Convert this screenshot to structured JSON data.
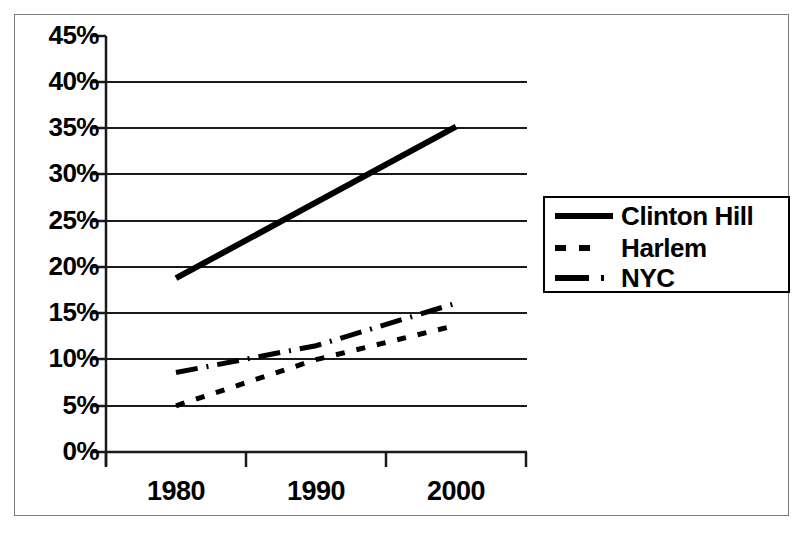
{
  "chart_data": {
    "type": "line",
    "title": "",
    "xlabel": "",
    "ylabel": "",
    "categories": [
      "1980",
      "1990",
      "2000"
    ],
    "x_tick_labels": [
      "1980",
      "1990",
      "2000"
    ],
    "y_tick_labels": [
      "0%",
      "5%",
      "10%",
      "15%",
      "20%",
      "25%",
      "30%",
      "35%",
      "40%",
      "45%"
    ],
    "y_tick_values": [
      0,
      5,
      10,
      15,
      20,
      25,
      30,
      35,
      40,
      45
    ],
    "ylim": [
      0,
      45
    ],
    "y_unit": "%",
    "grid": "horizontal",
    "legend_position": "right",
    "series": [
      {
        "name": "Clinton Hill",
        "line_style": "solid",
        "line_width": 5,
        "color": "#000000",
        "values": [
          18.8,
          27.0,
          35.2
        ]
      },
      {
        "name": "Harlem",
        "line_style": "dotted",
        "line_width": 4,
        "color": "#000000",
        "values": [
          5.0,
          10.0,
          13.7
        ]
      },
      {
        "name": "NYC",
        "line_style": "dashdot",
        "line_width": 4,
        "color": "#000000",
        "values": [
          8.6,
          11.5,
          16.1
        ]
      }
    ]
  },
  "legend": {
    "entries": [
      {
        "label": "Clinton Hill",
        "style": "solid"
      },
      {
        "label": "Harlem",
        "style": "dotted"
      },
      {
        "label": "NYC",
        "style": "dashdot"
      }
    ]
  },
  "colors": {
    "plot_line": "#000000",
    "gridline": "#1a1a1a",
    "axis": "#1a1a1a",
    "frame": "#7d7d7d",
    "background": "#ffffff"
  }
}
